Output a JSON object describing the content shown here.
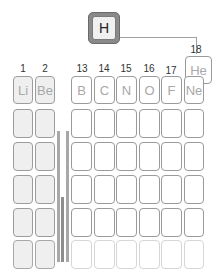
{
  "hydrogen": {
    "symbol": "H"
  },
  "helium": {
    "symbol": "He",
    "group": "18"
  },
  "group_labels": [
    "1",
    "2",
    "13",
    "14",
    "15",
    "16",
    "17"
  ],
  "period2": {
    "s_block": [
      "Li",
      "Be"
    ],
    "p_block": [
      "B",
      "C",
      "N",
      "O",
      "F",
      "Ne"
    ]
  }
}
